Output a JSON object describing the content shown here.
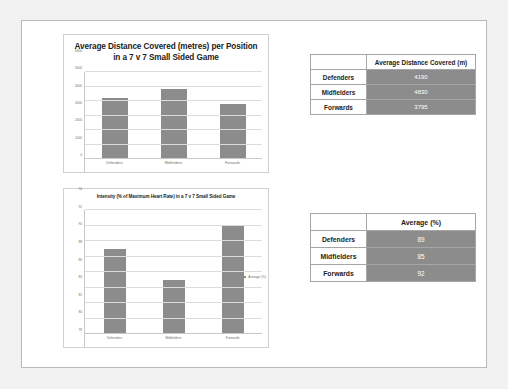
{
  "page": {
    "background_color": "#ffffff",
    "border_color": "#b9b9b9"
  },
  "theme": {
    "bar_color": "#8c8c8c",
    "table_value_bg": "#8c8c8c",
    "table_value_text": "#ffffff",
    "gridline_color": "#dcdcdc"
  },
  "chart_data": [
    {
      "type": "bar",
      "id": "distance-chart",
      "title": "Average Distance Covered (metres) per Position in a 7 v 7 Small Sided Game",
      "categories": [
        "Defenders",
        "Midfielders",
        "Forwards"
      ],
      "values": [
        4190,
        4830,
        3795
      ],
      "series_name": "Average Distance Covered (m)",
      "xlabel": "",
      "ylabel": "",
      "ylim": [
        0,
        6000
      ],
      "yticks": [
        0,
        1000,
        2000,
        3000,
        4000,
        5000,
        6000
      ],
      "ytick_labels": [
        "0",
        "1000",
        "2000",
        "3000",
        "4000",
        "5000",
        "6000"
      ],
      "grid": true,
      "legend": false,
      "legend_position": "none"
    },
    {
      "type": "bar",
      "id": "intensity-chart",
      "title": "Intensity (% of Maximum Heart Rate) in a 7 v 7 Small Sided Game",
      "categories": [
        "Defenders",
        "Midfielders",
        "Forwards"
      ],
      "values": [
        89,
        85,
        92
      ],
      "series_name": "Average (%)",
      "xlabel": "",
      "ylabel": "",
      "ylim": [
        78,
        94
      ],
      "yticks": [
        78,
        80,
        82,
        84,
        86,
        88,
        90,
        92,
        94
      ],
      "ytick_labels": [
        "78",
        "80",
        "82",
        "84",
        "86",
        "88",
        "90",
        "92",
        "94"
      ],
      "grid": true,
      "legend": true,
      "legend_position": "right",
      "legend_entries": [
        "Average (%)"
      ]
    }
  ],
  "tables": [
    {
      "id": "distance-table",
      "corner_header": "",
      "value_header": "Average Distance Covered (m)",
      "rows": [
        {
          "label": "Defenders",
          "value": "4190"
        },
        {
          "label": "Midfielders",
          "value": "4830"
        },
        {
          "label": "Forwards",
          "value": "3795"
        }
      ]
    },
    {
      "id": "intensity-table",
      "corner_header": "",
      "value_header": "Average (%)",
      "rows": [
        {
          "label": "Defenders",
          "value": "89"
        },
        {
          "label": "Midfielders",
          "value": "85"
        },
        {
          "label": "Forwards",
          "value": "92"
        }
      ]
    }
  ]
}
